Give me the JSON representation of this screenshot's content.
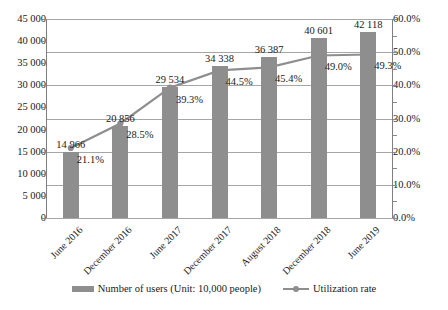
{
  "chart_data": {
    "type": "bar",
    "title": "",
    "subtitle": "",
    "xlabel": "",
    "ylabel": "",
    "categories": [
      "June 2016",
      "December 2016",
      "June 2017",
      "December 2017",
      "August 2018",
      "December 2018",
      "June 2019"
    ],
    "series": [
      {
        "name": "Number of users (Unit: 10,000 people)",
        "type": "bar",
        "axis": "left",
        "color": "#8e8e8e",
        "values": [
          14966,
          20856,
          29534,
          34338,
          36387,
          40601,
          42118
        ],
        "labels": [
          "14 966",
          "20 856",
          "29 534",
          "34 338",
          "36 387",
          "40 601",
          "42 118"
        ]
      },
      {
        "name": "Utilization rate",
        "type": "line",
        "axis": "right",
        "color": "#8e8e8e",
        "values": [
          21.1,
          28.5,
          39.3,
          44.5,
          45.4,
          49.0,
          49.3
        ],
        "labels": [
          "21.1%",
          "28.5%",
          "39.3%",
          "44.5%",
          "45.4%",
          "49.0%",
          "49.3%"
        ]
      }
    ],
    "left_axis": {
      "ylim": [
        0,
        45000
      ],
      "ticks": [
        0,
        5000,
        10000,
        15000,
        20000,
        25000,
        30000,
        35000,
        40000,
        45000
      ],
      "tick_labels": [
        "0",
        "5 000",
        "10 000",
        "15 000",
        "20 000",
        "25 000",
        "30 000",
        "35 000",
        "40 000",
        "45 000"
      ]
    },
    "right_axis": {
      "ylim": [
        0,
        60
      ],
      "ticks": [
        0,
        10,
        20,
        30,
        40,
        50,
        60
      ],
      "tick_labels": [
        "0.0%",
        "10.0%",
        "20.0%",
        "30.0%",
        "40.0%",
        "50.0%",
        "60.0%"
      ]
    },
    "grid": true,
    "legend_position": "bottom"
  },
  "legend": {
    "bar_label": "Number of users (Unit: 10,000 people)",
    "line_label": "Utilization rate"
  }
}
